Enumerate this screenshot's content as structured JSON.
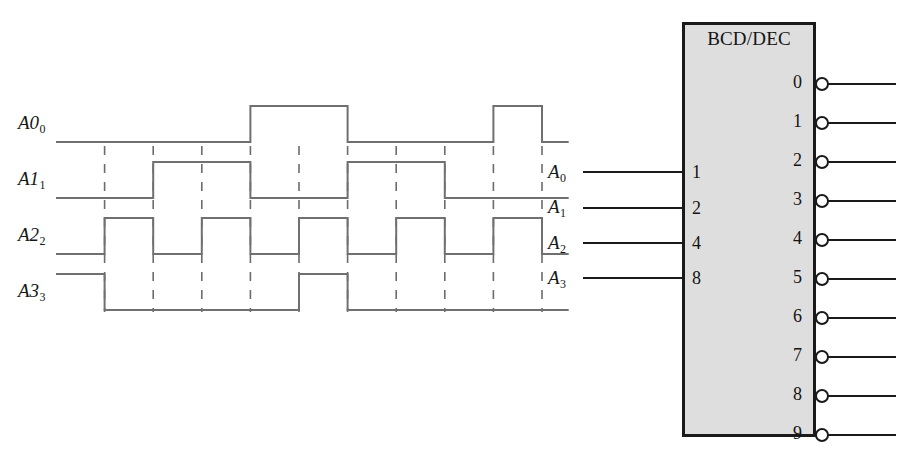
{
  "figure": {
    "colors": {
      "waveform_stroke": "#6f7072",
      "dash_stroke": "#6b6c6e",
      "block_border": "#1a1a1a",
      "block_fill": "#dedede",
      "wire_stroke": "#1a1a1a",
      "text": "#171717",
      "background": "#ffffff"
    }
  },
  "timing_diagram": {
    "name": "bcd-timing-waveforms",
    "signal_labels": [
      "A",
      "A",
      "A",
      "A"
    ],
    "signal_subscripts": [
      "0",
      "1",
      "2",
      "3"
    ],
    "signals": [
      {
        "label": "A0",
        "subscript": "0",
        "weight": 1,
        "levels": [
          0,
          0,
          0,
          0,
          1,
          1,
          0,
          0,
          0,
          1
        ]
      },
      {
        "label": "A1",
        "subscript": "1",
        "weight": 2,
        "levels": [
          0,
          0,
          1,
          1,
          0,
          0,
          1,
          1,
          0,
          0
        ]
      },
      {
        "label": "A2",
        "subscript": "2",
        "weight": 4,
        "levels": [
          0,
          1,
          0,
          1,
          0,
          1,
          0,
          1,
          0,
          1
        ]
      },
      {
        "label": "A3",
        "subscript": "3",
        "weight": 8,
        "levels": [
          1,
          0,
          0,
          0,
          0,
          1,
          0,
          0,
          0,
          0
        ]
      }
    ],
    "interval_count": 10,
    "grid_dashes": 10
  },
  "decoder_block": {
    "name": "bcd-dec-decoder",
    "title": "BCD/DEC",
    "inputs": [
      {
        "signal": "A",
        "subscript": "0",
        "pin": "1"
      },
      {
        "signal": "A",
        "subscript": "1",
        "pin": "2"
      },
      {
        "signal": "A",
        "subscript": "2",
        "pin": "4"
      },
      {
        "signal": "A",
        "subscript": "3",
        "pin": "8"
      }
    ],
    "outputs": [
      {
        "pin": "0",
        "inverted": true
      },
      {
        "pin": "1",
        "inverted": true
      },
      {
        "pin": "2",
        "inverted": true
      },
      {
        "pin": "3",
        "inverted": true
      },
      {
        "pin": "4",
        "inverted": true
      },
      {
        "pin": "5",
        "inverted": true
      },
      {
        "pin": "6",
        "inverted": true
      },
      {
        "pin": "7",
        "inverted": true
      },
      {
        "pin": "8",
        "inverted": true
      },
      {
        "pin": "9",
        "inverted": true
      }
    ]
  }
}
